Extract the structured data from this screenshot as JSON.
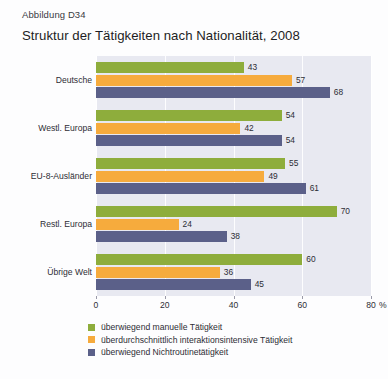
{
  "figure": {
    "label": "Abbildung D34",
    "title": "Struktur der Tätigkeiten nach Nationalität, 2008"
  },
  "chart_data": {
    "type": "bar",
    "orientation": "horizontal",
    "title": "Struktur der Tätigkeiten nach Nationalität, 2008",
    "xlabel": "80 %",
    "ylabel": "",
    "xlim": [
      0,
      80
    ],
    "xticks": [
      0,
      20,
      40,
      60,
      80
    ],
    "xtick_labels": [
      "0",
      "20",
      "40",
      "60",
      "80"
    ],
    "x_unit": "%",
    "grid": true,
    "legend_position": "below",
    "categories": [
      "Deutsche",
      "Westl. Europa",
      "EU-8-Ausländer",
      "Restl. Europa",
      "Übrige Welt"
    ],
    "series": [
      {
        "name": "überwiegend manuelle Tätigkeit",
        "color": "#8ead3c",
        "values": [
          43,
          54,
          55,
          70,
          60
        ]
      },
      {
        "name": "überdurchschnittlich interaktionsintensive Tätigkeit",
        "color": "#f6ab3d",
        "values": [
          57,
          42,
          49,
          24,
          36
        ]
      },
      {
        "name": "überwiegend Nichtroutinetätigkeit",
        "color": "#5b6089",
        "values": [
          68,
          54,
          61,
          38,
          45
        ]
      }
    ]
  },
  "legend": [
    {
      "label": "überwiegend manuelle Tätigkeit",
      "color": "#8ead3c"
    },
    {
      "label": "überdurchschnittlich interaktionsintensive Tätigkeit",
      "color": "#f6ab3d"
    },
    {
      "label": "überwiegend Nichtroutinetätigkeit",
      "color": "#5b6089"
    }
  ]
}
